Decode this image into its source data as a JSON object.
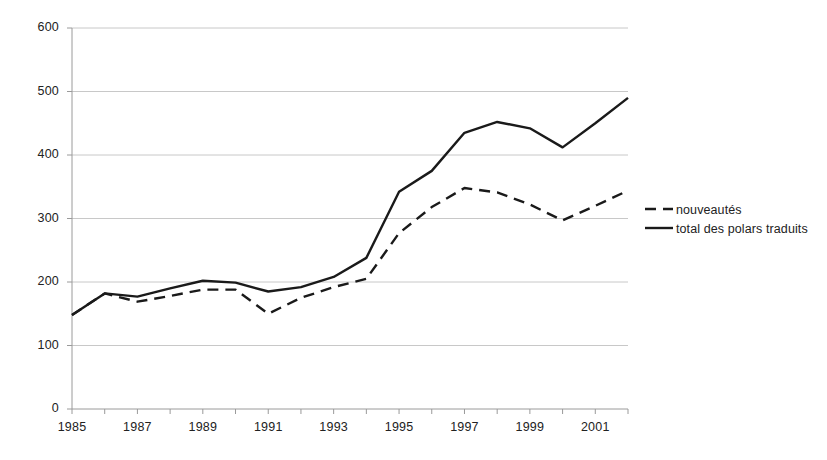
{
  "chart_data": {
    "type": "line",
    "title": "",
    "subtitle": "",
    "xlabel": "",
    "ylabel": "",
    "grid": true,
    "gridlines": "horizontal",
    "legend_position": "right",
    "xlim": [
      1985,
      2002
    ],
    "ylim": [
      0,
      600
    ],
    "x": [
      1985,
      1986,
      1987,
      1988,
      1989,
      1990,
      1991,
      1992,
      1993,
      1994,
      1995,
      1996,
      1997,
      1998,
      1999,
      2000,
      2001,
      2002
    ],
    "x_tick_labels": [
      "1985",
      "1987",
      "1989",
      "1991",
      "1993",
      "1995",
      "1997",
      "1999",
      "2001"
    ],
    "x_tick_values": [
      1985,
      1987,
      1989,
      1991,
      1993,
      1995,
      1997,
      1999,
      2001
    ],
    "y_tick_labels": [
      "0",
      "100",
      "200",
      "300",
      "400",
      "500",
      "600"
    ],
    "y_tick_values": [
      0,
      100,
      200,
      300,
      400,
      500,
      600
    ],
    "series": [
      {
        "name": "nouveautés",
        "style": "dashed",
        "color": "#1a1a1a",
        "values": [
          148,
          182,
          169,
          178,
          188,
          188,
          150,
          175,
          192,
          205,
          277,
          318,
          348,
          341,
          322,
          297,
          320,
          344
        ]
      },
      {
        "name": "total des polars traduits",
        "style": "solid",
        "color": "#1a1a1a",
        "values": [
          148,
          182,
          177,
          190,
          202,
          199,
          185,
          192,
          208,
          238,
          342,
          375,
          435,
          452,
          442,
          412,
          450,
          490
        ]
      }
    ]
  },
  "legend": {
    "items": [
      {
        "label": "nouveautés",
        "marker": "dashed-line-marker"
      },
      {
        "label": "total des polars traduits",
        "marker": "solid-line-marker"
      }
    ]
  },
  "axes": {
    "y_axis_name": "value-axis",
    "x_axis_name": "year-axis"
  }
}
